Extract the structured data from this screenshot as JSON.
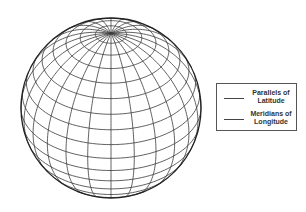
{
  "diagram": {
    "type": "globe-graticule",
    "globe": {
      "center_x": 111,
      "center_y": 108,
      "radius": 90,
      "tilt_deg": 56,
      "meridian_spacing_deg": 15,
      "parallel_spacing_deg": 10,
      "line_color": "#3a3a3a",
      "outline_color": "#222222"
    },
    "legend": {
      "items": [
        {
          "label_line1": "Parallels of",
          "label_line2": "Latitude",
          "line_color": "#444444"
        },
        {
          "label_line1": "Meridians of",
          "label_line2": "Longitude",
          "line_color": "#444444"
        }
      ]
    }
  }
}
